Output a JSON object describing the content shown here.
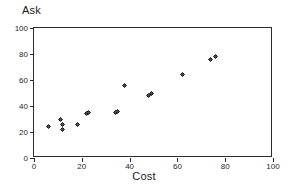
{
  "chart_data": {
    "type": "scatter",
    "title": "",
    "xlabel": "Cost",
    "ylabel": "Ask",
    "xlim": [
      0,
      100
    ],
    "ylim": [
      0,
      100
    ],
    "xticks": [
      0,
      20,
      40,
      60,
      80,
      100
    ],
    "yticks": [
      0,
      20,
      40,
      60,
      80,
      100
    ],
    "grid": false,
    "legend": null,
    "marker_color": "#111111",
    "frame_color": "#2b2b2b",
    "points": [
      {
        "x": 6,
        "y": 24
      },
      {
        "x": 11,
        "y": 30
      },
      {
        "x": 12,
        "y": 26
      },
      {
        "x": 12,
        "y": 22
      },
      {
        "x": 18,
        "y": 26
      },
      {
        "x": 22,
        "y": 34
      },
      {
        "x": 23,
        "y": 35
      },
      {
        "x": 34,
        "y": 35
      },
      {
        "x": 35,
        "y": 36
      },
      {
        "x": 38,
        "y": 56
      },
      {
        "x": 48,
        "y": 48
      },
      {
        "x": 49,
        "y": 50
      },
      {
        "x": 62,
        "y": 64
      },
      {
        "x": 74,
        "y": 76
      },
      {
        "x": 76,
        "y": 78
      }
    ]
  }
}
